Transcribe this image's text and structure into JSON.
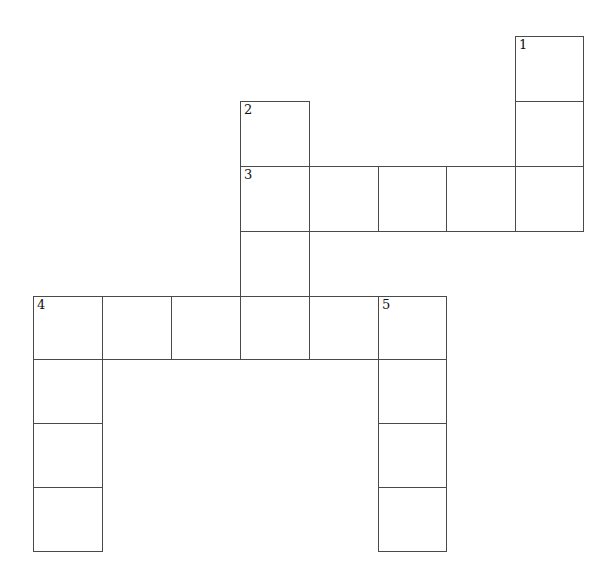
{
  "puzzle": {
    "type": "crossword",
    "clue_numbers": [
      "1",
      "2",
      "3",
      "4",
      "5"
    ],
    "entries": [
      {
        "number": "1",
        "direction": "down",
        "length": 3
      },
      {
        "number": "2",
        "direction": "down",
        "length": 4
      },
      {
        "number": "3",
        "direction": "across",
        "length": 5
      },
      {
        "number": "4",
        "direction": "across",
        "length": 6
      },
      {
        "number": "4",
        "direction": "down",
        "length": 4
      },
      {
        "number": "5",
        "direction": "down",
        "length": 4
      }
    ]
  },
  "layout": {
    "col_x": [
      33,
      102,
      171,
      240,
      309,
      378,
      446,
      515,
      583
    ],
    "row_y": [
      36,
      101,
      166,
      231,
      296,
      359,
      423,
      487,
      551
    ],
    "cells": [
      {
        "c": 7,
        "r": 0,
        "num": "1"
      },
      {
        "c": 7,
        "r": 1
      },
      {
        "c": 3,
        "r": 1,
        "num": "2"
      },
      {
        "c": 3,
        "r": 2,
        "num": "3"
      },
      {
        "c": 4,
        "r": 2
      },
      {
        "c": 5,
        "r": 2
      },
      {
        "c": 6,
        "r": 2
      },
      {
        "c": 7,
        "r": 2
      },
      {
        "c": 3,
        "r": 3
      },
      {
        "c": 0,
        "r": 4,
        "num": "4"
      },
      {
        "c": 1,
        "r": 4
      },
      {
        "c": 2,
        "r": 4
      },
      {
        "c": 3,
        "r": 4
      },
      {
        "c": 4,
        "r": 4
      },
      {
        "c": 5,
        "r": 4,
        "num": "5"
      },
      {
        "c": 0,
        "r": 5
      },
      {
        "c": 0,
        "r": 6
      },
      {
        "c": 0,
        "r": 7
      },
      {
        "c": 5,
        "r": 5
      },
      {
        "c": 5,
        "r": 6
      },
      {
        "c": 5,
        "r": 7
      }
    ]
  }
}
